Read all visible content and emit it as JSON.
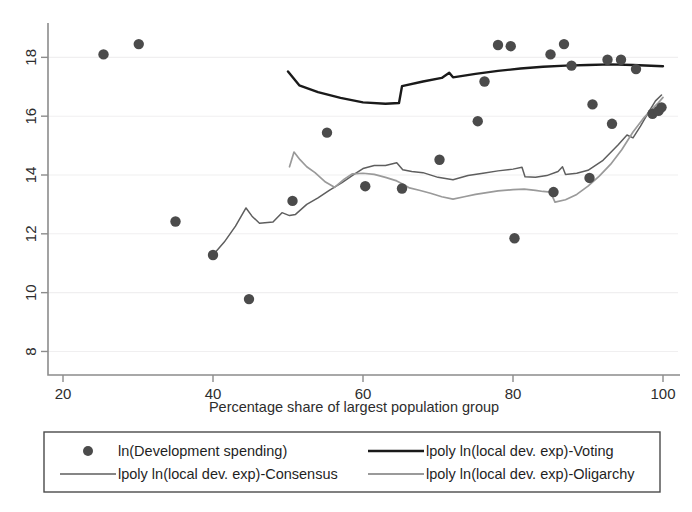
{
  "chart_data": {
    "type": "scatter",
    "title": "",
    "subtitle": "",
    "xlabel": "Percentage share of largest population group",
    "ylabel": "",
    "xlim": [
      18,
      102
    ],
    "ylim": [
      7.2,
      19.1
    ],
    "xticks": [
      20,
      40,
      60,
      80,
      100
    ],
    "yticks": [
      8,
      10,
      12,
      14,
      16,
      18
    ],
    "xtick_labels": [
      "20",
      "40",
      "60",
      "80",
      "100"
    ],
    "ytick_labels": [
      "8",
      "10",
      "12",
      "14",
      "16",
      "18"
    ],
    "grid": "horizontal-faint",
    "legend_position": "bottom",
    "marker_color": "#4b4b4b",
    "series": [
      {
        "name": "ln(Development spending)",
        "type": "scatter",
        "marker": "filled-circle",
        "color": "#4b4b4b",
        "points": [
          [
            25.4,
            18.1
          ],
          [
            30.1,
            18.45
          ],
          [
            35.0,
            12.42
          ],
          [
            40.0,
            11.28
          ],
          [
            44.8,
            9.78
          ],
          [
            50.6,
            13.12
          ],
          [
            55.2,
            15.44
          ],
          [
            60.3,
            13.62
          ],
          [
            65.2,
            13.54
          ],
          [
            70.2,
            14.52
          ],
          [
            75.3,
            15.83
          ],
          [
            76.2,
            17.18
          ],
          [
            78.0,
            18.42
          ],
          [
            79.7,
            18.38
          ],
          [
            80.2,
            11.85
          ],
          [
            85.0,
            18.1
          ],
          [
            85.4,
            13.42
          ],
          [
            86.8,
            18.45
          ],
          [
            87.8,
            17.72
          ],
          [
            90.2,
            13.9
          ],
          [
            90.6,
            16.4
          ],
          [
            92.6,
            17.92
          ],
          [
            93.2,
            15.74
          ],
          [
            94.4,
            17.92
          ],
          [
            96.4,
            17.6
          ],
          [
            98.6,
            16.08
          ],
          [
            99.4,
            16.18
          ],
          [
            99.8,
            16.3
          ]
        ]
      },
      {
        "name": "lpoly ln(local dev. exp)-Voting",
        "type": "line",
        "color": "#1a1a1a",
        "width": 2.4,
        "points": [
          [
            50.0,
            17.52
          ],
          [
            51.5,
            17.05
          ],
          [
            54.0,
            16.82
          ],
          [
            57.0,
            16.62
          ],
          [
            60.0,
            16.47
          ],
          [
            63.0,
            16.42
          ],
          [
            64.8,
            16.45
          ],
          [
            65.2,
            17.02
          ],
          [
            68.0,
            17.18
          ],
          [
            70.5,
            17.3
          ],
          [
            71.5,
            17.48
          ],
          [
            72.0,
            17.32
          ],
          [
            75.0,
            17.44
          ],
          [
            78.0,
            17.54
          ],
          [
            81.0,
            17.62
          ],
          [
            84.0,
            17.68
          ],
          [
            87.0,
            17.72
          ],
          [
            90.0,
            17.74
          ],
          [
            93.0,
            17.76
          ],
          [
            96.0,
            17.74
          ],
          [
            100.0,
            17.7
          ]
        ]
      },
      {
        "name": "lpoly ln(local dev. exp)-Consensus",
        "type": "line",
        "color": "#5e5e5e",
        "width": 1.5,
        "points": [
          [
            40.0,
            11.28
          ],
          [
            41.5,
            11.72
          ],
          [
            43.0,
            12.26
          ],
          [
            44.4,
            12.88
          ],
          [
            45.2,
            12.6
          ],
          [
            46.2,
            12.36
          ],
          [
            48.0,
            12.4
          ],
          [
            49.2,
            12.72
          ],
          [
            50.2,
            12.62
          ],
          [
            51.0,
            12.66
          ],
          [
            52.5,
            13.0
          ],
          [
            54.0,
            13.22
          ],
          [
            55.5,
            13.48
          ],
          [
            57.2,
            13.74
          ],
          [
            58.8,
            14.02
          ],
          [
            60.0,
            14.22
          ],
          [
            61.5,
            14.32
          ],
          [
            63.0,
            14.32
          ],
          [
            64.5,
            14.42
          ],
          [
            65.3,
            14.18
          ],
          [
            66.5,
            14.12
          ],
          [
            68.0,
            14.08
          ],
          [
            70.0,
            13.92
          ],
          [
            72.0,
            13.84
          ],
          [
            74.0,
            13.98
          ],
          [
            76.0,
            14.06
          ],
          [
            78.0,
            14.14
          ],
          [
            80.0,
            14.2
          ],
          [
            81.2,
            14.26
          ],
          [
            81.6,
            13.94
          ],
          [
            83.0,
            13.92
          ],
          [
            84.5,
            13.98
          ],
          [
            86.0,
            14.12
          ],
          [
            86.6,
            14.28
          ],
          [
            87.0,
            14.02
          ],
          [
            88.5,
            14.06
          ],
          [
            90.0,
            14.16
          ],
          [
            92.0,
            14.5
          ],
          [
            94.0,
            15.02
          ],
          [
            95.2,
            15.36
          ],
          [
            96.0,
            15.26
          ],
          [
            97.0,
            15.66
          ],
          [
            98.0,
            16.1
          ],
          [
            99.0,
            16.52
          ],
          [
            99.8,
            16.72
          ]
        ]
      },
      {
        "name": "lpoly ln(local dev. exp)-Oligarchy",
        "type": "line",
        "color": "#9a9a9a",
        "width": 1.7,
        "points": [
          [
            50.2,
            14.28
          ],
          [
            50.8,
            14.78
          ],
          [
            51.6,
            14.52
          ],
          [
            52.5,
            14.28
          ],
          [
            53.6,
            14.08
          ],
          [
            55.0,
            13.76
          ],
          [
            56.2,
            13.58
          ],
          [
            57.5,
            13.86
          ],
          [
            58.6,
            14.04
          ],
          [
            60.0,
            14.06
          ],
          [
            61.5,
            14.02
          ],
          [
            63.0,
            13.92
          ],
          [
            64.5,
            13.8
          ],
          [
            65.4,
            13.68
          ],
          [
            66.2,
            13.56
          ],
          [
            67.5,
            13.48
          ],
          [
            69.0,
            13.38
          ],
          [
            70.5,
            13.26
          ],
          [
            72.0,
            13.18
          ],
          [
            73.5,
            13.26
          ],
          [
            75.0,
            13.34
          ],
          [
            76.5,
            13.4
          ],
          [
            78.0,
            13.46
          ],
          [
            80.0,
            13.5
          ],
          [
            81.5,
            13.52
          ],
          [
            83.0,
            13.48
          ],
          [
            84.0,
            13.44
          ],
          [
            85.0,
            13.42
          ],
          [
            85.6,
            13.08
          ],
          [
            87.0,
            13.16
          ],
          [
            88.5,
            13.34
          ],
          [
            90.0,
            13.62
          ],
          [
            91.5,
            13.96
          ],
          [
            93.0,
            14.36
          ],
          [
            94.5,
            14.86
          ],
          [
            96.0,
            15.46
          ],
          [
            97.5,
            15.96
          ],
          [
            98.6,
            16.26
          ],
          [
            99.4,
            16.46
          ],
          [
            100.0,
            16.64
          ]
        ]
      }
    ],
    "legend": [
      {
        "label": "ln(Development spending)",
        "marker": "dot",
        "color": "#4b4b4b"
      },
      {
        "label": "lpoly ln(local dev. exp)-Voting",
        "marker": "line",
        "color": "#1a1a1a"
      },
      {
        "label": "lpoly ln(local dev. exp)-Consensus",
        "marker": "line",
        "color": "#5e5e5e"
      },
      {
        "label": "lpoly ln(local dev. exp)-Oligarchy",
        "marker": "line",
        "color": "#9a9a9a"
      }
    ]
  }
}
